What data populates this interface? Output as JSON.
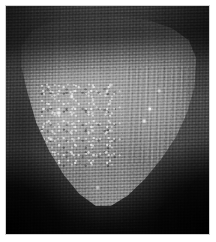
{
  "image": {
    "kind": "photograph",
    "title": "Grayscale macro photograph of a tongue-shaped specimen",
    "color_mode": "grayscale",
    "orientation": "portrait",
    "width_px": 216,
    "height_px": 242,
    "caption": "",
    "border": {
      "style": "white paper margin",
      "color": "#ffffff",
      "left_px": 6,
      "top_px": 6,
      "right_px": 7,
      "bottom_px": 8
    },
    "plate": {
      "x_px": 6,
      "y_px": 6,
      "width_px": 203,
      "height_px": 228,
      "background_color": "#0a0a0a"
    },
    "palette": {
      "highlight": "#e8e8e8",
      "specimen_light": "#a6a6a6",
      "specimen_mid": "#7e7e7e",
      "specimen_dark": "#555555",
      "surround_mid": "#3f3f3f",
      "surround_dark": "#1a1a1a",
      "deep_shadow": "#070707",
      "paper": "#ffffff"
    },
    "subject": {
      "name": "specimen-body",
      "description": "Broad rounded-triangular pale grey mass filling the upper two thirds of the frame, tapering to a rounded tip at the bottom centre.",
      "shape": "rounded triangle / tongue tip",
      "position": "centred, slightly above vertical centre"
    },
    "regions": [
      {
        "name": "upper-shadow-band",
        "label": "Dark diagonal shadow band across the top edge",
        "tone": "dark"
      },
      {
        "name": "papillae-texture-patch",
        "label": "Speckled granular highlight patch on the left-centre surface",
        "tone": "mottled light"
      },
      {
        "name": "right-streak-highlights",
        "label": "Vertical streaked highlights along the right flank",
        "tone": "light"
      },
      {
        "name": "lower-tip",
        "label": "Rounded bright tip at the bottom centre",
        "tone": "light"
      },
      {
        "name": "bottom-left-shadow",
        "label": "Deep black shadow in the lower-left corner",
        "tone": "black"
      },
      {
        "name": "bottom-right-shadow",
        "label": "Deep black shadow in the lower-right corner",
        "tone": "black"
      }
    ],
    "artifacts": {
      "scanline_texture": "Fine near-horizontal scan/halftone lines across the whole plate",
      "cross_hatch": "Faint vertical cross-hatch producing a moire weave",
      "grain": "Visible film/sensor grain",
      "focus": "Soft, slightly out-of-focus macro"
    },
    "overlays": {
      "text": [],
      "annotations": [],
      "scale_bar": null
    }
  }
}
